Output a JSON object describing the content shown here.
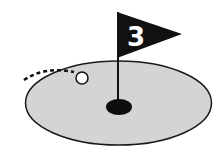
{
  "illustration": {
    "subject": "golf-hole-icon",
    "flag_number": "3",
    "colors": {
      "background": "#ffffff",
      "green": "#d4d4d4",
      "outline": "#1a1a1a",
      "flag": "#111111",
      "flag_text": "#ffffff",
      "hole": "#0d0d0d",
      "ball": "#ffffff"
    }
  }
}
